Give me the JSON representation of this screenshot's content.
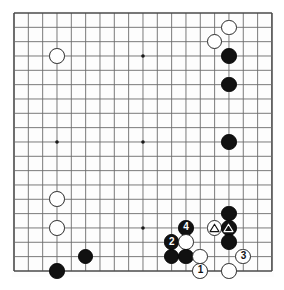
{
  "figure": {
    "kind": "go-board-diagram",
    "board_size": 19,
    "visible_columns": 19,
    "visible_rows": 19,
    "colors": {
      "black_stone": "#111111",
      "white_stone": "#ffffff",
      "stone_outline": "#2a2a2a",
      "grid_line": "#6b6b6b",
      "border_line": "#4a4a4a",
      "star_point": "#1a1a1a",
      "background": "#ffffff"
    },
    "geometry": {
      "origin_x": 2,
      "origin_y": 2,
      "spacing": 14.33,
      "stone_diameter": 15.6,
      "star_radius": 1.8,
      "board_width": 262,
      "board_height": 266
    }
  },
  "star_points": [
    {
      "col": 4,
      "row": 4
    },
    {
      "col": 10,
      "row": 4
    },
    {
      "col": 16,
      "row": 4
    },
    {
      "col": 4,
      "row": 10
    },
    {
      "col": 10,
      "row": 10
    },
    {
      "col": 16,
      "row": 10
    },
    {
      "col": 4,
      "row": 16
    },
    {
      "col": 10,
      "row": 16
    },
    {
      "col": 16,
      "row": 16
    }
  ],
  "stones": [
    {
      "id": "w-r2-c16",
      "color": "white",
      "col": 16,
      "row": 2,
      "label": "",
      "marker": ""
    },
    {
      "id": "w-r3-c15",
      "color": "white",
      "col": 15,
      "row": 3,
      "label": "",
      "marker": ""
    },
    {
      "id": "w-r4-c4",
      "color": "white",
      "col": 4,
      "row": 4,
      "label": "",
      "marker": ""
    },
    {
      "id": "b-r4-c16",
      "color": "black",
      "col": 16,
      "row": 4,
      "label": "",
      "marker": ""
    },
    {
      "id": "b-r6-c16",
      "color": "black",
      "col": 16,
      "row": 6,
      "label": "",
      "marker": ""
    },
    {
      "id": "b-r10-c16",
      "color": "black",
      "col": 16,
      "row": 10,
      "label": "",
      "marker": ""
    },
    {
      "id": "w-r14-c4",
      "color": "white",
      "col": 4,
      "row": 14,
      "label": "",
      "marker": ""
    },
    {
      "id": "b-r15-c16",
      "color": "black",
      "col": 16,
      "row": 15,
      "label": "",
      "marker": ""
    },
    {
      "id": "b-r16-c13",
      "color": "black",
      "col": 13,
      "row": 16,
      "label": "4",
      "marker": ""
    },
    {
      "id": "w-r16-c15",
      "color": "white",
      "col": 15,
      "row": 16,
      "label": "",
      "marker": "triangle"
    },
    {
      "id": "b-r16-c16",
      "color": "black",
      "col": 16,
      "row": 16,
      "label": "",
      "marker": "triangle"
    },
    {
      "id": "w-r16-c4",
      "color": "white",
      "col": 4,
      "row": 16,
      "label": "",
      "marker": ""
    },
    {
      "id": "b-r17-c12",
      "color": "black",
      "col": 12,
      "row": 17,
      "label": "2",
      "marker": ""
    },
    {
      "id": "w-r17-c13",
      "color": "white",
      "col": 13,
      "row": 17,
      "label": "",
      "marker": ""
    },
    {
      "id": "b-r17-c16",
      "color": "black",
      "col": 16,
      "row": 17,
      "label": "",
      "marker": ""
    },
    {
      "id": "b-r18-c6",
      "color": "black",
      "col": 6,
      "row": 18,
      "label": "",
      "marker": ""
    },
    {
      "id": "b-r18-c12",
      "color": "black",
      "col": 12,
      "row": 18,
      "label": "",
      "marker": ""
    },
    {
      "id": "b-r18-c13",
      "color": "black",
      "col": 13,
      "row": 18,
      "label": "",
      "marker": ""
    },
    {
      "id": "w-r18-c14",
      "color": "white",
      "col": 14,
      "row": 18,
      "label": "",
      "marker": ""
    },
    {
      "id": "w-r18-c17",
      "color": "white",
      "col": 17,
      "row": 18,
      "label": "3",
      "marker": ""
    },
    {
      "id": "b-r19-c4",
      "color": "black",
      "col": 4,
      "row": 19,
      "label": "",
      "marker": ""
    },
    {
      "id": "w-r19-c14",
      "color": "white",
      "col": 14,
      "row": 19,
      "label": "1",
      "marker": ""
    },
    {
      "id": "w-r19-c16",
      "color": "white",
      "col": 16,
      "row": 19,
      "label": "",
      "marker": ""
    }
  ],
  "move_sequence": [
    {
      "number": "1",
      "color": "white",
      "col": 14,
      "row": 19
    },
    {
      "number": "2",
      "color": "black",
      "col": 12,
      "row": 17
    },
    {
      "number": "3",
      "color": "white",
      "col": 17,
      "row": 18
    },
    {
      "number": "4",
      "color": "black",
      "col": 13,
      "row": 16
    }
  ],
  "marked_stones": [
    {
      "marker": "triangle",
      "color": "white",
      "col": 15,
      "row": 16
    },
    {
      "marker": "triangle",
      "color": "black",
      "col": 16,
      "row": 16
    }
  ]
}
